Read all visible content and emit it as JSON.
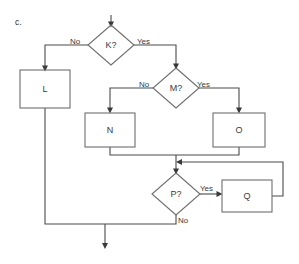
{
  "figure": {
    "panel_label": "c.",
    "background_color": "#ffffff",
    "stroke_color": "#6e6e6e",
    "connector_color": "#4a4a4a",
    "text_color": "#3a3a3a"
  },
  "nodes": [
    {
      "id": "K",
      "type": "decision",
      "label": "K?",
      "cx": 111,
      "cy": 45,
      "rx": 23,
      "ry": 20
    },
    {
      "id": "L",
      "type": "process",
      "label": "L",
      "x": 20,
      "y": 70,
      "w": 50,
      "h": 38
    },
    {
      "id": "M",
      "type": "decision",
      "label": "M?",
      "cx": 176,
      "cy": 88,
      "rx": 23,
      "ry": 20
    },
    {
      "id": "N",
      "type": "process",
      "label": "N",
      "x": 85,
      "y": 113,
      "w": 50,
      "h": 34
    },
    {
      "id": "O",
      "type": "process",
      "label": "O",
      "x": 213,
      "y": 113,
      "w": 52,
      "h": 34
    },
    {
      "id": "P",
      "type": "decision",
      "label": "P?",
      "cx": 176,
      "cy": 194,
      "rx": 24,
      "ry": 21
    },
    {
      "id": "Q",
      "type": "process",
      "label": "Q",
      "x": 222,
      "y": 180,
      "w": 50,
      "h": 32
    }
  ],
  "edges": [
    {
      "id": "entry-to-K",
      "from": "start",
      "to": "K",
      "label": "",
      "path": "M 111 15 L 111 25"
    },
    {
      "id": "K-no-to-L",
      "from": "K",
      "to": "L",
      "label": "No",
      "path": "M 88 45 L 45 45 L 45 70",
      "label_x": 70,
      "label_y": 44
    },
    {
      "id": "K-yes-to-M",
      "from": "K",
      "to": "M",
      "label": "Yes",
      "path": "M 134 45 L 176 45 L 176 68",
      "label_x": 138,
      "label_y": 44
    },
    {
      "id": "M-no-to-N",
      "from": "M",
      "to": "N",
      "label": "No",
      "path": "M 153 88 L 110 88 L 110 113",
      "label_x": 140,
      "label_y": 87
    },
    {
      "id": "M-yes-to-O",
      "from": "M",
      "to": "O",
      "label": "Yes",
      "path": "M 199 88 L 239 88 L 239 113",
      "label_x": 197,
      "label_y": 87
    },
    {
      "id": "N-to-merge",
      "from": "N",
      "to": "P",
      "label": "",
      "path": "M 110 147 L 110 155 L 176 155 L 176 173"
    },
    {
      "id": "O-to-merge",
      "from": "O",
      "to": "P",
      "label": "",
      "path": "M 239 147 L 239 155 L 176 155"
    },
    {
      "id": "P-yes-to-Q",
      "from": "P",
      "to": "Q",
      "label": "Yes",
      "path": "M 200 194 L 222 194",
      "label_x": 200,
      "label_y": 190
    },
    {
      "id": "Q-feedback",
      "from": "Q",
      "to": "P",
      "label": "",
      "path": "M 272 196 L 283 196 L 283 162 L 176 162"
    },
    {
      "id": "P-no-to-exit",
      "from": "P",
      "to": "end",
      "label": "No",
      "path": "M 176 215 L 176 224 L 105 224 L 105 248",
      "label_x": 178,
      "label_y": 216
    },
    {
      "id": "L-to-exit",
      "from": "L",
      "to": "end",
      "label": "",
      "path": "M 45 108 L 45 224 L 105 224"
    }
  ],
  "terminals": {
    "entry_arrow": {
      "x": 111,
      "y": 26
    },
    "exit_arrow": {
      "x": 105,
      "y": 249
    }
  }
}
